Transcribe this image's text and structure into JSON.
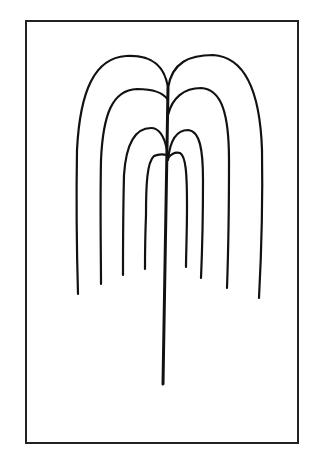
{
  "figure": {
    "title": "Weeping willow line drawing",
    "stroke_color": "#111111",
    "background": "#ffffff",
    "frame": {
      "x": 26,
      "y": 21,
      "width": 272,
      "height": 422
    },
    "trunk": {
      "x_top": 168,
      "y_top": 88,
      "x_bottom": 163,
      "y_bottom": 384
    },
    "branches": [
      {
        "id": "left-1",
        "d": "M168,88 C164,60 145,55 126,56 C95,58 80,90 77,150 C76,210 77,260 78,294"
      },
      {
        "id": "left-2",
        "d": "M168,100 C163,92 152,89 137,89 C112,90 103,115 101,160 C100,210 101,255 101,284"
      },
      {
        "id": "left-3",
        "d": "M167,150 C164,135 158,128 151,128 C134,128 126,145 124,175 C123,215 123,250 123,275"
      },
      {
        "id": "left-4",
        "d": "M167,155 C163,154 158,154 154,156 C147,162 146,185 146,215 C145,240 145,258 145,269"
      },
      {
        "id": "right-1",
        "d": "M168,88 C172,62 190,55 213,55 C245,57 260,90 262,150 C263,210 261,260 259,298"
      },
      {
        "id": "right-2",
        "d": "M168,115 C172,98 184,88 201,88 C222,89 229,115 229,160 C229,215 228,260 227,288"
      },
      {
        "id": "right-3",
        "d": "M168,160 C170,140 177,130 188,130 C200,131 203,150 203,180 C203,220 202,255 201,278"
      },
      {
        "id": "right-4",
        "d": "M168,158 C172,153 176,152 180,153 C186,156 187,175 187,205 C187,235 186,255 186,267"
      }
    ]
  }
}
